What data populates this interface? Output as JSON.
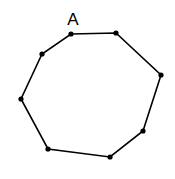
{
  "figure": {
    "kind": "polygon-figure",
    "background_color": "#ffffff",
    "stroke_color": "#000000",
    "vertex_color": "#000000",
    "stroke_width": 1.6,
    "vertex_radius": 2.6,
    "width": 175,
    "height": 179
  },
  "chart_data": {
    "type": "scatter",
    "title": "",
    "subtitle": "",
    "xlabel": "",
    "ylabel": "",
    "grid": false,
    "legend": null,
    "shape": "octagon",
    "closed": true,
    "vertex_count": 8,
    "xlim": [
      0,
      175
    ],
    "ylim": [
      0,
      179
    ],
    "annotations": [
      {
        "text": "A",
        "x": 73,
        "y": 25,
        "anchor": "middle",
        "attached_vertex_index": 0
      }
    ],
    "series": [
      {
        "name": "octagon-outline",
        "points": [
          {
            "label": "A",
            "x": 71,
            "y": 34
          },
          {
            "label": "",
            "x": 116,
            "y": 33
          },
          {
            "label": "",
            "x": 161,
            "y": 75
          },
          {
            "label": "",
            "x": 143,
            "y": 131
          },
          {
            "label": "",
            "x": 110,
            "y": 157
          },
          {
            "label": "",
            "x": 48,
            "y": 149
          },
          {
            "label": "",
            "x": 21,
            "y": 99
          },
          {
            "label": "",
            "x": 42,
            "y": 54
          }
        ]
      }
    ]
  },
  "labels": {
    "vertex_a": "A"
  }
}
